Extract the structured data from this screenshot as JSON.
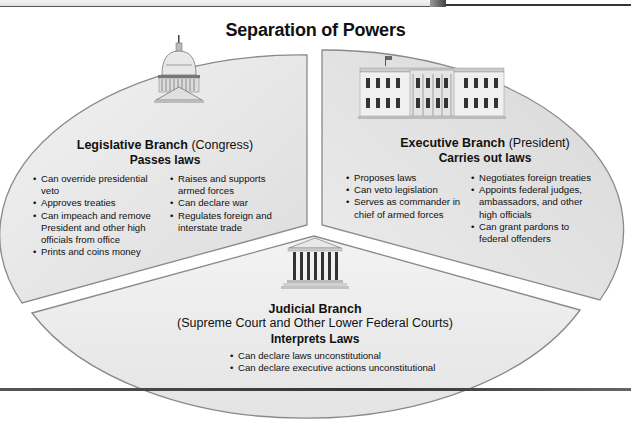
{
  "title": "Separation of Powers",
  "colors": {
    "wedge_fill": "#e6e6e6",
    "wedge_fill_light": "#efefef",
    "wedge_edge": "#8a8a8a",
    "text": "#111111"
  },
  "legislative": {
    "icon": "capitol-building-icon",
    "name": "Legislative Branch",
    "qualifier": "(Congress)",
    "role": "Passes laws",
    "powers_col1": [
      "Can override presidential veto",
      "Approves treaties",
      "Can impeach and remove President and other high officials from office",
      "Prints and coins money"
    ],
    "powers_col2": [
      "Raises and supports armed forces",
      "Can declare war",
      "Regulates foreign and interstate trade"
    ]
  },
  "executive": {
    "icon": "white-house-icon",
    "name": "Executive Branch",
    "qualifier": "(President)",
    "role": "Carries out laws",
    "powers_col1": [
      "Proposes laws",
      "Can veto legislation",
      "Serves as commander in chief of armed forces"
    ],
    "powers_col2": [
      "Negotiates foreign treaties",
      "Appoints federal judges, ambassadors, and other high officials",
      "Can grant pardons to federal offenders"
    ]
  },
  "judicial": {
    "icon": "supreme-court-icon",
    "name": "Judicial Branch",
    "qualifier": "(Supreme Court and Other Lower Federal Courts)",
    "role": "Interprets Laws",
    "powers": [
      "Can declare laws unconstitutional",
      "Can declare executive actions unconstitutional"
    ]
  }
}
